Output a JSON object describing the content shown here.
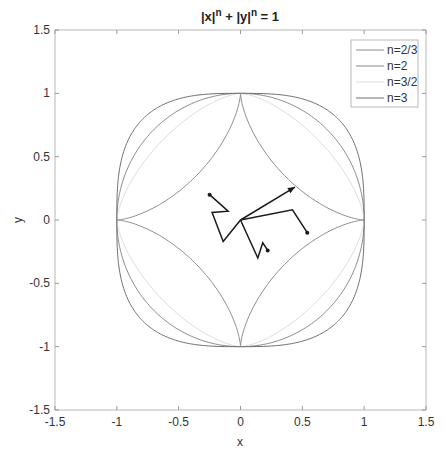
{
  "chart_data": {
    "type": "line",
    "title_parts": {
      "base1": "|x|",
      "exp1": "n",
      "mid": " + |y|",
      "exp2": "n",
      "tail": " = 1"
    },
    "xlabel": "x",
    "ylabel": "y",
    "xlim": [
      -1.5,
      1.5
    ],
    "ylim": [
      -1.5,
      1.5
    ],
    "xticks": [
      -1.5,
      -1,
      -0.5,
      0,
      0.5,
      1,
      1.5
    ],
    "yticks": [
      -1.5,
      -1,
      -0.5,
      0,
      0.5,
      1,
      1.5
    ],
    "xtick_labels": [
      "-1.5",
      "-1",
      "-0.5",
      "0",
      "0.5",
      "1",
      "1.5"
    ],
    "ytick_labels": [
      "-1.5",
      "-1",
      "-0.5",
      "0",
      "0.5",
      "1",
      "1.5"
    ],
    "grid": false,
    "legend_position": "top-right",
    "series": [
      {
        "name": "n=2/3",
        "exponent": 0.6667,
        "color": "#8c8c8c"
      },
      {
        "name": "n=2",
        "exponent": 2,
        "color": "#8a8a8a"
      },
      {
        "name": "n=3/2",
        "exponent": 1.5,
        "color": "#dcdcdc"
      },
      {
        "name": "n=3",
        "exponent": 3,
        "color": "#6f6f6f"
      }
    ],
    "walk": {
      "color": "#1a1a1a",
      "paths": [
        {
          "points": [
            [
              0,
              0
            ],
            [
              0.44,
              0.26
            ]
          ],
          "end_marker": "arrow"
        },
        {
          "points": [
            [
              0,
              0
            ],
            [
              0.42,
              0.08
            ],
            [
              0.54,
              -0.1
            ]
          ],
          "end_marker": "dot"
        },
        {
          "points": [
            [
              0,
              0
            ],
            [
              -0.14,
              -0.17
            ],
            [
              -0.23,
              0.06
            ],
            [
              -0.1,
              0.07
            ],
            [
              -0.25,
              0.2
            ]
          ],
          "end_marker": "dot"
        },
        {
          "points": [
            [
              0,
              0
            ],
            [
              0.14,
              -0.3
            ],
            [
              0.18,
              -0.18
            ],
            [
              0.22,
              -0.24
            ]
          ],
          "end_marker": "dot"
        }
      ]
    }
  }
}
